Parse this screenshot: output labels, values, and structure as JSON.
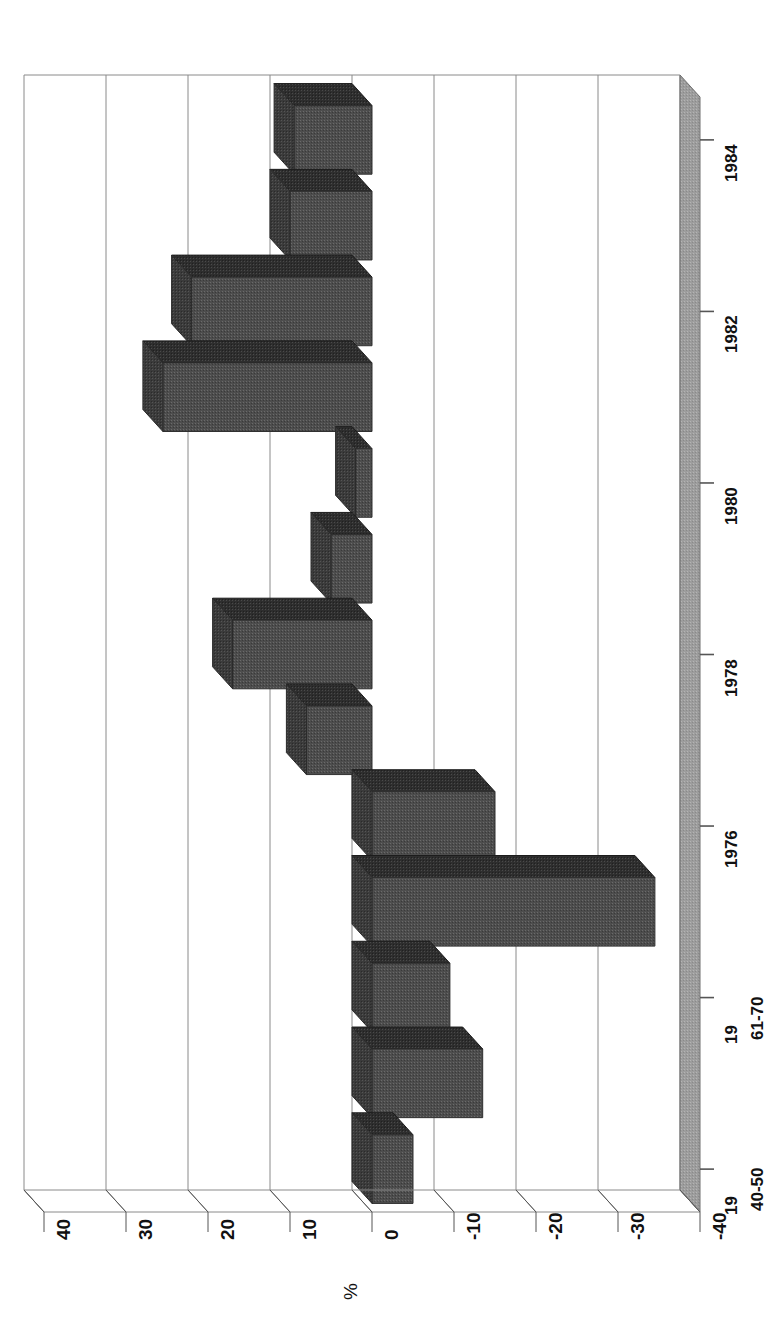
{
  "figure": {
    "orientation": "page-rotated-90",
    "background": "#ffffff"
  },
  "axis_title": "%",
  "chart_data": {
    "type": "bar",
    "title": "",
    "subtitle": "",
    "xlabel": "",
    "ylabel": "%",
    "orientation": "horizontal-3d",
    "grid": true,
    "legend": "none",
    "ylim": [
      -40,
      40
    ],
    "yticks": [
      40,
      30,
      20,
      10,
      0,
      -10,
      -20,
      -30,
      -40
    ],
    "ytick_labels": [
      "40",
      "30",
      "20",
      "10",
      "0",
      "-10",
      "-20",
      "-30",
      "-40"
    ],
    "categories": [
      "1984",
      "1983",
      "1982",
      "1981",
      "1980",
      "1979",
      "1978",
      "1977",
      "1976",
      "1975",
      "19 61-70",
      "19 51-60",
      "19 40-50"
    ],
    "category_tick_labels": [
      "1984",
      "1982",
      "1980",
      "1978",
      "1976",
      "19 61-70",
      "19 40-50"
    ],
    "values": [
      9.5,
      10,
      22,
      25.5,
      2,
      5,
      17,
      8,
      -15,
      -34.5,
      -9.5,
      -13.5,
      -5
    ]
  },
  "tick_labels_value": [
    {
      "text": "40",
      "value": 40
    },
    {
      "text": "30",
      "value": 30
    },
    {
      "text": "20",
      "value": 20
    },
    {
      "text": "10",
      "value": 10
    },
    {
      "text": "0",
      "value": 0
    },
    {
      "text": "-10",
      "value": -10
    },
    {
      "text": "-20",
      "value": -20
    },
    {
      "text": "-30",
      "value": -30
    },
    {
      "text": "-40",
      "value": -40
    }
  ],
  "tick_labels_category": [
    {
      "line1": "",
      "line2": "1984",
      "index": 0
    },
    {
      "line1": "",
      "line2": "1982",
      "index": 2
    },
    {
      "line1": "",
      "line2": "1980",
      "index": 4
    },
    {
      "line1": "",
      "line2": "1978",
      "index": 6
    },
    {
      "line1": "",
      "line2": "1976",
      "index": 8
    },
    {
      "line1": "19",
      "line2": "61-70",
      "index": 10
    },
    {
      "line1": "19",
      "line2": "40-50",
      "index": 12
    }
  ],
  "colors": {
    "bar_front": "#4a4a4a",
    "bar_top": "#2b2b2b",
    "bar_side": "#3a3a3a",
    "floor": "#9a9a9a",
    "grid": "#8a8a8a",
    "axis": "#555555",
    "text": "#111111"
  }
}
